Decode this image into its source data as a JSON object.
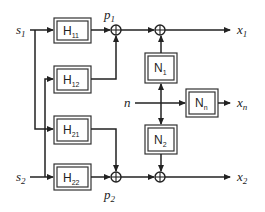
{
  "diagram": {
    "inputs": {
      "s1": {
        "base": "s",
        "sub": "1"
      },
      "s2": {
        "base": "s",
        "sub": "2"
      },
      "n": {
        "base": "n",
        "sub": ""
      }
    },
    "outputs": {
      "x1": {
        "base": "x",
        "sub": "1"
      },
      "x2": {
        "base": "x",
        "sub": "2"
      },
      "xn": {
        "base": "x",
        "sub": "n"
      }
    },
    "intermediate": {
      "p1": {
        "base": "p",
        "sub": "1"
      },
      "p2": {
        "base": "p",
        "sub": "2"
      }
    },
    "blocks": {
      "H11": {
        "base": "H",
        "sub": "11"
      },
      "H12": {
        "base": "H",
        "sub": "12"
      },
      "H21": {
        "base": "H",
        "sub": "21"
      },
      "H22": {
        "base": "H",
        "sub": "22"
      },
      "N1": {
        "base": "N",
        "sub": "1"
      },
      "N2": {
        "base": "N",
        "sub": "2"
      },
      "Nn": {
        "base": "N",
        "sub": "n"
      }
    },
    "summing_junction_symbol": "⊕",
    "colors": {
      "line": "#222222",
      "block_border_band": "#9a9a9a",
      "background": "#ffffff"
    }
  }
}
